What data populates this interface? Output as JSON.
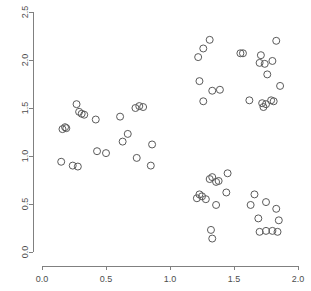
{
  "chart_data": {
    "type": "scatter",
    "title": "",
    "xlabel": "",
    "ylabel": "",
    "xlim": [
      0.0,
      2.0
    ],
    "ylim": [
      0.0,
      2.5
    ],
    "grid": false,
    "legend": false,
    "marker": "open-circle",
    "marker_color": "#5a5a5a",
    "marker_size_px": 7,
    "xticks": [
      0.0,
      0.5,
      1.0,
      1.5,
      2.0
    ],
    "xtick_labels": [
      "0.0",
      "0.5",
      "1.0",
      "1.5",
      "2.0"
    ],
    "yticks": [
      0.0,
      0.5,
      1.0,
      1.5,
      2.0,
      2.5
    ],
    "ytick_labels": [
      "0.0",
      "0.5",
      "1.0",
      "1.5",
      "2.0",
      "2.5"
    ],
    "n_points": 81,
    "clusters": 3,
    "series": [
      {
        "name": "cluster-1",
        "points": [
          [
            0.27,
            1.54
          ],
          [
            0.29,
            1.46
          ],
          [
            0.31,
            1.44
          ],
          [
            0.33,
            1.43
          ],
          [
            0.42,
            1.38
          ],
          [
            0.16,
            1.28
          ],
          [
            0.18,
            1.3
          ],
          [
            0.19,
            1.29
          ],
          [
            0.61,
            1.41
          ],
          [
            0.73,
            1.5
          ],
          [
            0.76,
            1.52
          ],
          [
            0.79,
            1.51
          ],
          [
            0.67,
            1.23
          ],
          [
            0.63,
            1.15
          ],
          [
            0.86,
            1.12
          ],
          [
            0.43,
            1.05
          ],
          [
            0.5,
            1.03
          ],
          [
            0.74,
            0.98
          ],
          [
            0.15,
            0.94
          ],
          [
            0.24,
            0.9
          ],
          [
            0.28,
            0.89
          ],
          [
            0.85,
            0.9
          ]
        ]
      },
      {
        "name": "cluster-2",
        "points": [
          [
            1.31,
            2.21
          ],
          [
            1.26,
            2.12
          ],
          [
            1.22,
            2.03
          ],
          [
            1.55,
            2.07
          ],
          [
            1.57,
            2.07
          ],
          [
            1.71,
            2.05
          ],
          [
            1.83,
            2.2
          ],
          [
            1.74,
            1.96
          ],
          [
            1.7,
            1.97
          ],
          [
            1.8,
            1.99
          ],
          [
            1.23,
            1.78
          ],
          [
            1.76,
            1.85
          ],
          [
            1.33,
            1.68
          ],
          [
            1.39,
            1.69
          ],
          [
            1.26,
            1.57
          ],
          [
            1.62,
            1.58
          ],
          [
            1.86,
            1.73
          ],
          [
            1.72,
            1.55
          ],
          [
            1.75,
            1.54
          ],
          [
            1.79,
            1.58
          ],
          [
            1.81,
            1.57
          ],
          [
            1.73,
            1.51
          ]
        ]
      },
      {
        "name": "cluster-3",
        "points": [
          [
            1.45,
            0.82
          ],
          [
            1.33,
            0.78
          ],
          [
            1.31,
            0.76
          ],
          [
            1.38,
            0.74
          ],
          [
            1.36,
            0.73
          ],
          [
            1.44,
            0.62
          ],
          [
            1.23,
            0.6
          ],
          [
            1.25,
            0.58
          ],
          [
            1.21,
            0.56
          ],
          [
            1.28,
            0.55
          ],
          [
            1.36,
            0.49
          ],
          [
            1.66,
            0.6
          ],
          [
            1.63,
            0.49
          ],
          [
            1.75,
            0.52
          ],
          [
            1.83,
            0.45
          ],
          [
            1.69,
            0.35
          ],
          [
            1.85,
            0.33
          ],
          [
            1.32,
            0.23
          ],
          [
            1.33,
            0.14
          ],
          [
            1.7,
            0.21
          ],
          [
            1.75,
            0.22
          ],
          [
            1.8,
            0.22
          ],
          [
            1.84,
            0.21
          ]
        ]
      }
    ]
  }
}
